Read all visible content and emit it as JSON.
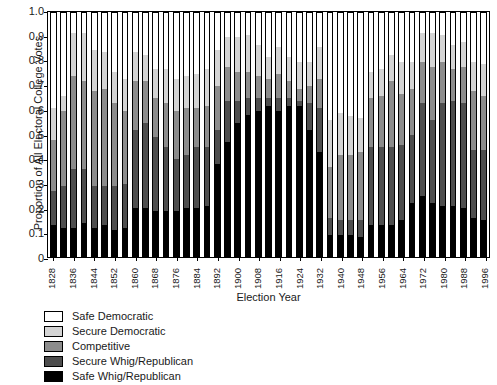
{
  "chart_data": {
    "type": "bar",
    "subtype": "stacked-bar-100percent",
    "title": "",
    "xlabel": "Election Year",
    "ylabel": "Proportion of All Electoral College Votes",
    "ylim": [
      0,
      1.0
    ],
    "ytick_labels": [
      "0",
      "0.1",
      "0.2",
      "0.3",
      "0.4",
      "0.5",
      "0.6",
      "0.7",
      "0.8",
      "0.9",
      "1.0"
    ],
    "ytick_values": [
      0,
      0.1,
      0.2,
      0.3,
      0.4,
      0.5,
      0.6,
      0.7,
      0.8,
      0.9,
      1.0
    ],
    "grid": false,
    "legend_position": "below-plot-left",
    "categories": [
      "1828",
      "1832",
      "1836",
      "1840",
      "1844",
      "1848",
      "1852",
      "1856",
      "1860",
      "1864",
      "1868",
      "1872",
      "1876",
      "1880",
      "1884",
      "1888",
      "1892",
      "1896",
      "1900",
      "1904",
      "1908",
      "1912",
      "1916",
      "1920",
      "1924",
      "1928",
      "1932",
      "1936",
      "1940",
      "1944",
      "1948",
      "1952",
      "1956",
      "1960",
      "1964",
      "1968",
      "1972",
      "1976",
      "1980",
      "1984",
      "1988",
      "1992",
      "1996"
    ],
    "xtick_labeled": [
      "1828",
      "1836",
      "1844",
      "1852",
      "1860",
      "1868",
      "1876",
      "1884",
      "1892",
      "1900",
      "1908",
      "1916",
      "1924",
      "1932",
      "1940",
      "1948",
      "1956",
      "1964",
      "1972",
      "1980",
      "1988",
      "1996"
    ],
    "series": [
      {
        "name": "Safe Whig/Republican",
        "color": "#000000",
        "values": [
          0.13,
          0.12,
          0.12,
          0.14,
          0.12,
          0.13,
          0.11,
          0.12,
          0.2,
          0.2,
          0.19,
          0.19,
          0.19,
          0.2,
          0.2,
          0.21,
          0.38,
          0.47,
          0.55,
          0.58,
          0.6,
          0.62,
          0.6,
          0.62,
          0.62,
          0.52,
          0.43,
          0.09,
          0.09,
          0.09,
          0.08,
          0.13,
          0.13,
          0.13,
          0.15,
          0.22,
          0.25,
          0.22,
          0.21,
          0.21,
          0.2,
          0.16,
          0.15
        ]
      },
      {
        "name": "Secure Whig/Republican",
        "color": "#4d4d4d",
        "values": [
          0.14,
          0.17,
          0.24,
          0.22,
          0.17,
          0.16,
          0.18,
          0.18,
          0.32,
          0.35,
          0.3,
          0.26,
          0.21,
          0.22,
          0.25,
          0.24,
          0.14,
          0.17,
          0.09,
          0.07,
          0.05,
          0.03,
          0.05,
          0.03,
          0.02,
          0.11,
          0.18,
          0.07,
          0.06,
          0.06,
          0.07,
          0.32,
          0.32,
          0.32,
          0.31,
          0.28,
          0.38,
          0.34,
          0.42,
          0.43,
          0.43,
          0.28,
          0.29
        ]
      },
      {
        "name": "Competitive",
        "color": "#8c8c8c",
        "values": [
          0.21,
          0.31,
          0.38,
          0.36,
          0.39,
          0.4,
          0.34,
          0.3,
          0.2,
          0.17,
          0.16,
          0.18,
          0.2,
          0.19,
          0.16,
          0.17,
          0.18,
          0.14,
          0.12,
          0.11,
          0.09,
          0.08,
          0.1,
          0.07,
          0.05,
          0.07,
          0.12,
          0.21,
          0.27,
          0.27,
          0.28,
          0.2,
          0.21,
          0.27,
          0.21,
          0.19,
          0.17,
          0.22,
          0.17,
          0.13,
          0.15,
          0.24,
          0.22
        ]
      },
      {
        "name": "Secure Democratic",
        "color": "#d4d4d4",
        "values": [
          0.13,
          0.06,
          0.18,
          0.2,
          0.17,
          0.15,
          0.13,
          0.13,
          0.12,
          0.11,
          0.12,
          0.14,
          0.13,
          0.13,
          0.14,
          0.15,
          0.15,
          0.12,
          0.14,
          0.15,
          0.13,
          0.09,
          0.11,
          0.1,
          0.11,
          0.1,
          0.13,
          0.19,
          0.17,
          0.16,
          0.14,
          0.11,
          0.11,
          0.11,
          0.13,
          0.11,
          0.12,
          0.14,
          0.11,
          0.1,
          0.1,
          0.12,
          0.13
        ]
      },
      {
        "name": "Safe Democratic",
        "color": "#ffffff",
        "values": [
          0.39,
          0.34,
          0.08,
          0.08,
          0.15,
          0.16,
          0.24,
          0.27,
          0.16,
          0.17,
          0.23,
          0.23,
          0.27,
          0.26,
          0.25,
          0.23,
          0.15,
          0.1,
          0.1,
          0.09,
          0.13,
          0.18,
          0.14,
          0.18,
          0.2,
          0.2,
          0.14,
          0.44,
          0.41,
          0.42,
          0.43,
          0.24,
          0.23,
          0.17,
          0.2,
          0.2,
          0.08,
          0.08,
          0.09,
          0.13,
          0.12,
          0.2,
          0.21
        ]
      }
    ],
    "legend": [
      {
        "label": "Safe Democratic",
        "color": "#ffffff"
      },
      {
        "label": "Secure Democratic",
        "color": "#d4d4d4"
      },
      {
        "label": "Competitive",
        "color": "#8c8c8c"
      },
      {
        "label": "Secure Whig/Republican",
        "color": "#4d4d4d"
      },
      {
        "label": "Safe Whig/Republican",
        "color": "#000000"
      }
    ]
  }
}
